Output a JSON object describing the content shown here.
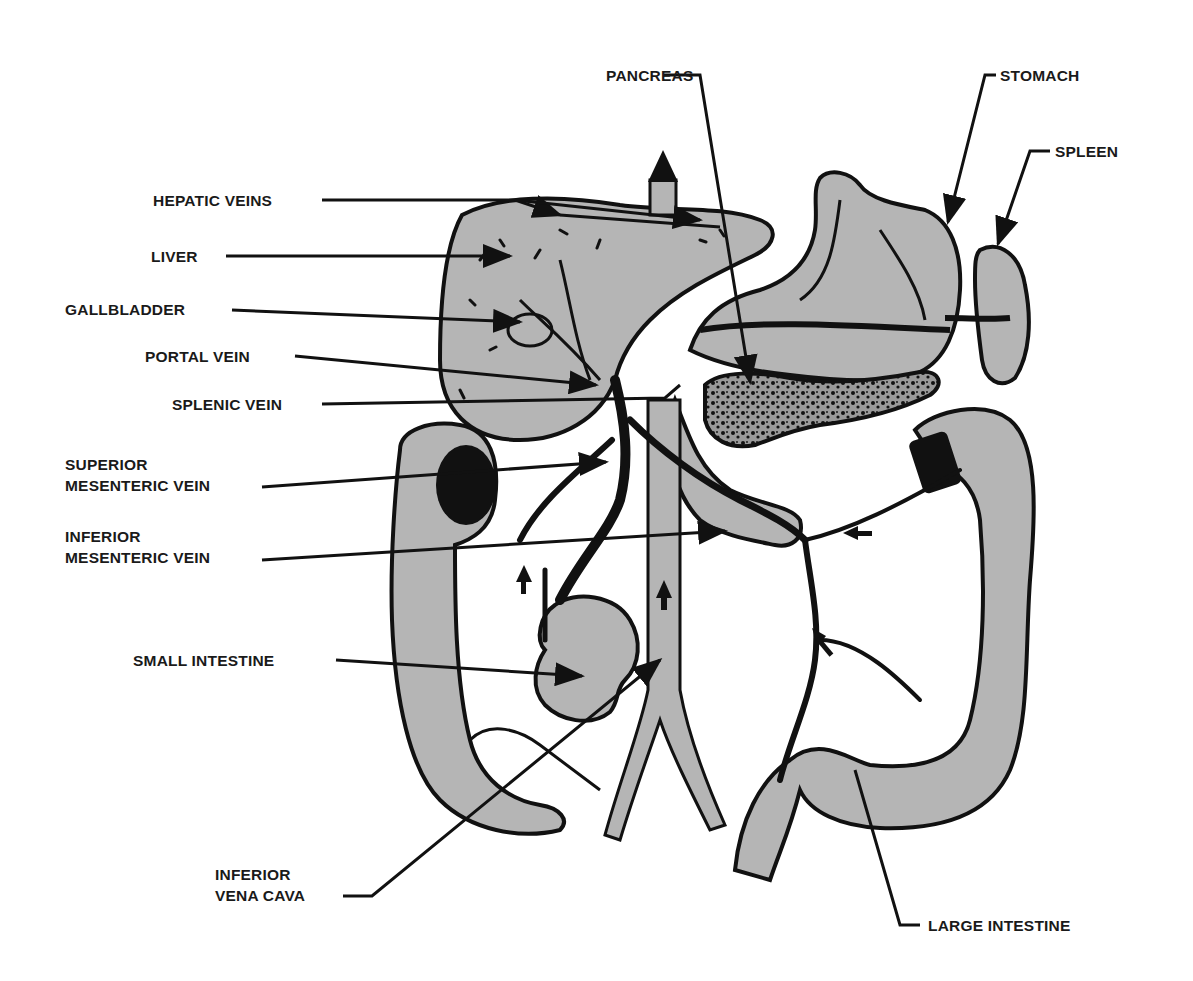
{
  "diagram": {
    "type": "anatomical illustration",
    "colors": {
      "organ_fill": "#b5b5b5",
      "outline": "#111111",
      "background": "#ffffff",
      "label_text": "#1a1a1a"
    },
    "labels": {
      "pancreas": "PANCREAS",
      "stomach": "STOMACH",
      "spleen": "SPLEEN",
      "hepatic_veins": "HEPATIC VEINS",
      "liver": "LIVER",
      "gallbladder": "GALLBLADDER",
      "portal_vein": "PORTAL VEIN",
      "splenic_vein": "SPLENIC VEIN",
      "superior_mesenteric_vein_1": "SUPERIOR",
      "superior_mesenteric_vein_2": "MESENTERIC VEIN",
      "inferior_mesenteric_vein_1": "INFERIOR",
      "inferior_mesenteric_vein_2": "MESENTERIC VEIN",
      "small_intestine": "SMALL INTESTINE",
      "inferior_vena_cava_1": "INFERIOR",
      "inferior_vena_cava_2": "VENA CAVA",
      "large_intestine": "LARGE INTESTINE"
    }
  }
}
